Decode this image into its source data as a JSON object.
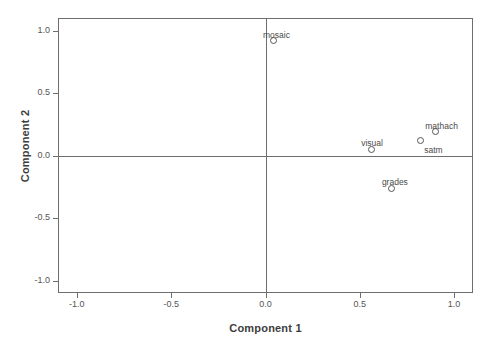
{
  "chart_data": {
    "type": "scatter",
    "title": "",
    "xlabel": "Component 1",
    "ylabel": "Component 2",
    "xlim": [
      -1.1,
      1.1
    ],
    "ylim": [
      -1.1,
      1.1
    ],
    "xticks": [
      "-1.0",
      "-0.5",
      "0.0",
      "0.5",
      "1.0"
    ],
    "xtick_values": [
      -1.0,
      -0.5,
      0.0,
      0.5,
      1.0
    ],
    "yticks": [
      "1.0",
      "0.5",
      "0.0",
      "-0.5",
      "-1.0"
    ],
    "ytick_values": [
      1.0,
      0.5,
      0.0,
      -0.5,
      -1.0
    ],
    "grid": false,
    "legend": false,
    "reference_lines": {
      "vertical_at_x": 0.0,
      "horizontal_at_y": 0.0
    },
    "marker_style": "open-circle",
    "points": [
      {
        "label": "mosaic",
        "x": 0.04,
        "y": 0.92,
        "label_dx": -10,
        "label_dy": -11
      },
      {
        "label": "mathach",
        "x": 0.9,
        "y": 0.19,
        "label_dx": -10,
        "label_dy": -11
      },
      {
        "label": "satm",
        "x": 0.82,
        "y": 0.12,
        "label_dx": 4,
        "label_dy": 4
      },
      {
        "label": "visual",
        "x": 0.56,
        "y": 0.05,
        "label_dx": -10,
        "label_dy": -11
      },
      {
        "label": "grades",
        "x": 0.67,
        "y": -0.26,
        "label_dx": -10,
        "label_dy": -11
      }
    ]
  },
  "axes": {
    "x_title": "Component 1",
    "y_title": "Component 2"
  },
  "colors": {
    "frame": "#6e6e6e",
    "marker_stroke": "#555555",
    "text": "#4a4a4a",
    "background": "#ffffff"
  }
}
